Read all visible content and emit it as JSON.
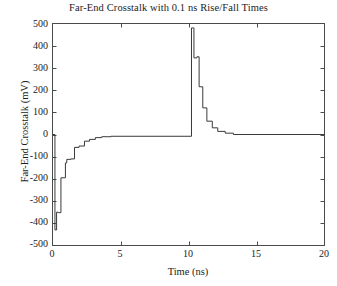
{
  "chart_data": {
    "type": "line",
    "title": "Far-End Crosstalk with 0.1 ns Rise/Fall Times",
    "xlabel": "Time (ns)",
    "ylabel": "Far-End Crosstalk (mV)",
    "xlim": [
      0,
      20
    ],
    "ylim": [
      -500,
      500
    ],
    "xticks": [
      0,
      5,
      10,
      15,
      20
    ],
    "yticks": [
      -500,
      -400,
      -300,
      -200,
      -100,
      0,
      100,
      200,
      300,
      400,
      500
    ],
    "xtick_labels": [
      "0",
      "5",
      "10",
      "15",
      "20"
    ],
    "ytick_labels": [
      "-500",
      "-400",
      "-300",
      "-200",
      "-100",
      "0",
      "100",
      "200",
      "300",
      "400",
      "500"
    ],
    "grid": false,
    "legend": null,
    "line_color": "#3a3a3a",
    "series": [
      {
        "name": "Far-End Crosstalk",
        "x": [
          0.0,
          0.18,
          0.18,
          0.3,
          0.3,
          0.42,
          0.42,
          0.62,
          0.62,
          0.95,
          0.95,
          1.05,
          1.05,
          1.35,
          1.35,
          1.62,
          1.62,
          1.95,
          1.95,
          2.35,
          2.35,
          2.72,
          2.72,
          3.15,
          3.15,
          3.62,
          3.62,
          4.3,
          4.3,
          10.22,
          10.22,
          10.4,
          10.4,
          10.62,
          10.62,
          10.78,
          10.78,
          11.05,
          11.05,
          11.35,
          11.35,
          11.75,
          11.75,
          12.15,
          12.15,
          12.7,
          12.7,
          13.3,
          13.3,
          20.0
        ],
        "y": [
          0,
          0,
          -430,
          -430,
          -350,
          -350,
          -352,
          -352,
          -195,
          -195,
          -128,
          -128,
          -112,
          -112,
          -110,
          -110,
          -58,
          -58,
          -52,
          -52,
          -30,
          -30,
          -22,
          -22,
          -14,
          -14,
          -10,
          -10,
          -8,
          -8,
          480,
          480,
          345,
          345,
          350,
          350,
          215,
          215,
          120,
          120,
          60,
          60,
          30,
          30,
          14,
          14,
          6,
          6,
          0,
          0
        ]
      }
    ]
  }
}
